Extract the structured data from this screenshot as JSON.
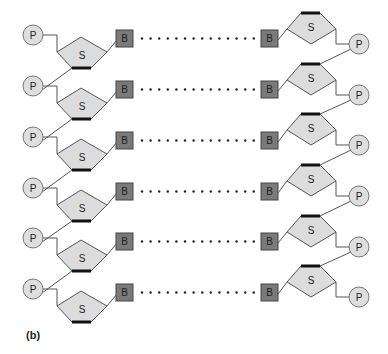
{
  "diagram": {
    "caption": "(b)",
    "colors": {
      "phosphate_fill": "#dedede",
      "sugar_fill": "#dcdcdc",
      "base_fill": "#7a7a7a",
      "stroke": "#555555",
      "thick_edge": "#111111",
      "dots": "#222222"
    },
    "labels": {
      "phosphate": "P",
      "sugar": "S",
      "base": "B"
    },
    "left_strand": {
      "rows_y": [
        35,
        86,
        137,
        188,
        238,
        289
      ]
    },
    "right_strand": {
      "rows_y": [
        44,
        95,
        145,
        196,
        247,
        297
      ]
    },
    "row_count": 6,
    "dots_per_pair": 14
  }
}
